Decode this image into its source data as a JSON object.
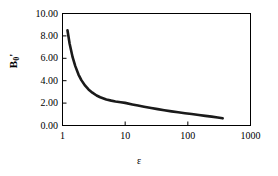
{
  "chart_data": {
    "type": "line",
    "title": "",
    "xlabel": "ε",
    "ylabel": "Bo'",
    "ylabel_base": "B",
    "ylabel_sub": "0",
    "ylabel_prime": "'",
    "xscale": "log",
    "yscale": "linear",
    "xlim": [
      1,
      1000
    ],
    "ylim": [
      0,
      10
    ],
    "grid": false,
    "legend": null,
    "xticks": [
      {
        "value": 1,
        "label": "1"
      },
      {
        "value": 10,
        "label": "10"
      },
      {
        "value": 100,
        "label": "100"
      },
      {
        "value": 1000,
        "label": "1000"
      }
    ],
    "yticks": [
      {
        "value": 10,
        "label": "10.00"
      },
      {
        "value": 8,
        "label": "8.00"
      },
      {
        "value": 6,
        "label": "6.00"
      },
      {
        "value": 4,
        "label": "4.00"
      },
      {
        "value": 2,
        "label": "2.00"
      },
      {
        "value": 0,
        "label": "0.00"
      }
    ],
    "series": [
      {
        "name": "Bo'",
        "color": "#1a1a1a",
        "linewidth": 2.6,
        "x": [
          1.2,
          1.3,
          1.45,
          1.6,
          1.8,
          2.0,
          2.3,
          2.6,
          3.0,
          3.5,
          4.0,
          5.0,
          6.0,
          7.0,
          8.5,
          10.0,
          13.0,
          16.0,
          20.0,
          26.0,
          33.0,
          42.0,
          55.0,
          70.0,
          90.0,
          115.0,
          150.0,
          190.0,
          240.0,
          300.0,
          360.0
        ],
        "y": [
          8.5,
          7.3,
          6.1,
          5.3,
          4.55,
          4.05,
          3.55,
          3.22,
          2.93,
          2.68,
          2.52,
          2.32,
          2.22,
          2.15,
          2.08,
          2.02,
          1.88,
          1.78,
          1.68,
          1.56,
          1.46,
          1.36,
          1.26,
          1.18,
          1.1,
          1.02,
          0.93,
          0.86,
          0.79,
          0.72,
          0.64
        ]
      }
    ],
    "axes_color": "#000000",
    "background": "#ffffff"
  },
  "figure": {
    "width": 278,
    "height": 176
  }
}
